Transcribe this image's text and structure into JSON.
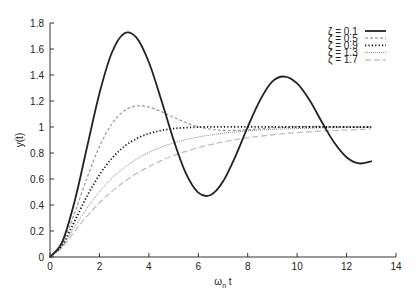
{
  "chart_data": {
    "type": "line",
    "title": "",
    "xlabel": "ωn t",
    "xlabel_main": "ω",
    "xlabel_sub": "n",
    "xlabel_tail": " t",
    "ylabel": "y(t)",
    "xlim": [
      0,
      14
    ],
    "ylim": [
      0,
      1.8
    ],
    "xticks": [
      0,
      2,
      4,
      6,
      8,
      10,
      12,
      14
    ],
    "xtick_labels": [
      "0",
      "2",
      "4",
      "6",
      "8",
      "10",
      "12",
      "14"
    ],
    "yticks": [
      0,
      0.2,
      0.4,
      0.6,
      0.8,
      1,
      1.2,
      1.4,
      1.6,
      1.8
    ],
    "ytick_labels": [
      "0",
      "0.2",
      "0.4",
      "0.6",
      "0.8",
      "1",
      "1.2",
      "1.4",
      "1.6",
      "1.8"
    ],
    "grid": false,
    "legend_position": "top-right",
    "x": [
      0,
      0.5,
      1,
      1.5,
      2,
      2.5,
      3,
      3.5,
      4,
      4.5,
      5,
      5.5,
      6,
      6.5,
      7,
      7.5,
      8,
      8.5,
      9,
      9.5,
      10,
      10.5,
      11,
      11.5,
      12,
      12.5,
      13
    ],
    "series": [
      {
        "name": "ζ = 0.1",
        "zeta": 0.1,
        "style": "solid",
        "color": "#222222",
        "values": [
          0,
          0.118,
          0.431,
          0.846,
          1.258,
          1.571,
          1.72,
          1.687,
          1.498,
          1.21,
          0.901,
          0.643,
          0.495,
          0.477,
          0.581,
          0.773,
          1.0,
          1.207,
          1.351,
          1.388,
          1.335,
          1.207,
          1.038,
          0.88,
          0.767,
          0.72,
          0.736
        ]
      },
      {
        "name": "ζ = 0.5",
        "zeta": 0.5,
        "style": "dashed",
        "color": "#999999",
        "values": [
          0,
          0.104,
          0.34,
          0.61,
          0.849,
          1.023,
          1.125,
          1.162,
          1.153,
          1.118,
          1.075,
          1.034,
          1.002,
          0.983,
          0.974,
          0.974,
          0.979,
          0.986,
          0.993,
          0.998,
          1.002,
          1.004,
          1.004,
          1.003,
          1.002,
          1.001,
          1.0
        ]
      },
      {
        "name": "ζ = 0.9",
        "zeta": 0.9,
        "style": "dotted",
        "color": "#111111",
        "values": [
          0,
          0.093,
          0.277,
          0.469,
          0.632,
          0.758,
          0.849,
          0.91,
          0.949,
          0.973,
          0.988,
          0.995,
          0.999,
          1.001,
          1.001,
          1.001,
          1.001,
          1.001,
          1.001,
          1.0,
          1.0,
          1.0,
          1.0,
          1.0,
          1.0,
          1.0,
          1.0
        ]
      },
      {
        "name": "ζ = 1.3",
        "zeta": 1.3,
        "style": "fine-dotted",
        "color": "#8a8a8a",
        "values": [
          0,
          0.083,
          0.232,
          0.377,
          0.502,
          0.605,
          0.687,
          0.752,
          0.804,
          0.845,
          0.877,
          0.903,
          0.923,
          0.939,
          0.952,
          0.962,
          0.97,
          0.976,
          0.981,
          0.985,
          0.988,
          0.991,
          0.993,
          0.994,
          0.995,
          0.996,
          0.997
        ]
      },
      {
        "name": "ζ = 1.7",
        "zeta": 1.7,
        "style": "long-dashed",
        "color": "#bbbbbb",
        "values": [
          0,
          0.075,
          0.198,
          0.315,
          0.417,
          0.504,
          0.578,
          0.642,
          0.695,
          0.741,
          0.78,
          0.813,
          0.841,
          0.865,
          0.885,
          0.902,
          0.917,
          0.929,
          0.94,
          0.949,
          0.957,
          0.963,
          0.969,
          0.973,
          0.977,
          0.981,
          0.984
        ]
      }
    ]
  }
}
